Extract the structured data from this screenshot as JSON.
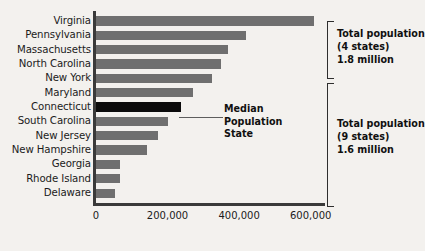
{
  "chart_data": {
    "type": "bar",
    "orientation": "horizontal",
    "title": "",
    "xlabel": "",
    "ylabel": "",
    "xlim": [
      0,
      640000
    ],
    "xticks": [
      0,
      200000,
      400000,
      600000
    ],
    "xticklabels": [
      "0",
      "200,000",
      "400,000",
      "600,000"
    ],
    "grid": false,
    "legend": false,
    "categories": [
      "Virginia",
      "Pennsylvania",
      "Massachusetts",
      "North Carolina",
      "New York",
      "Maryland",
      "Connecticut",
      "South Carolina",
      "New Jersey",
      "New Hampshire",
      "Georgia",
      "Rhode Island",
      "Delaware"
    ],
    "values": [
      610000,
      420000,
      370000,
      350000,
      325000,
      270000,
      238000,
      200000,
      172000,
      142000,
      66000,
      66000,
      52000
    ],
    "bar_color": "#6f6f6f",
    "highlight_color": "#0b0b0b",
    "highlight_category": "Connecticut",
    "background_color": "#f3f1ee",
    "annotations": [
      {
        "name": "median-callout",
        "lines": [
          "Median",
          "Population",
          "State"
        ],
        "target_category": "Connecticut"
      },
      {
        "name": "group-bracket-top",
        "lines": [
          "Total population",
          "(4 states)",
          "1.8 million"
        ],
        "covers": [
          "Virginia",
          "Pennsylvania",
          "Massachusetts",
          "North Carolina"
        ]
      },
      {
        "name": "group-bracket-bottom",
        "lines": [
          "Total population",
          "(9 states)",
          "1.6 million"
        ],
        "covers": [
          "New York",
          "Maryland",
          "Connecticut",
          "South Carolina",
          "New Jersey",
          "New Hampshire",
          "Georgia",
          "Rhode Island",
          "Delaware"
        ]
      }
    ]
  }
}
